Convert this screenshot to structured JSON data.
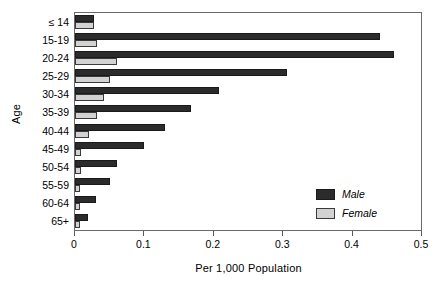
{
  "chart_data": {
    "type": "bar",
    "orientation": "horizontal",
    "title": "",
    "xlabel": "Per 1,000 Population",
    "ylabel": "Age",
    "xlim": [
      0,
      0.5
    ],
    "xticks": [
      "0",
      "0.1",
      "0.2",
      "0.3",
      "0.4",
      "0.5"
    ],
    "xtick_values": [
      0,
      0.1,
      0.2,
      0.3,
      0.4,
      0.5
    ],
    "grid": false,
    "legend_position": "lower-right-inside",
    "categories": [
      "≤ 14",
      "15-19",
      "20-24",
      "25-29",
      "30-34",
      "35-39",
      "40-44",
      "45-49",
      "50-54",
      "55-59",
      "60-64",
      "65+"
    ],
    "series": [
      {
        "name": "Male",
        "color": "#2b2b2b",
        "values": [
          0.028,
          0.44,
          0.46,
          0.305,
          0.207,
          0.167,
          0.13,
          0.1,
          0.06,
          0.05,
          0.03,
          0.019
        ]
      },
      {
        "name": "Female",
        "color": "#d2d2d2",
        "values": [
          0.027,
          0.031,
          0.061,
          0.051,
          0.042,
          0.031,
          0.02,
          0.008,
          0.008,
          0.007,
          0.007,
          0.007
        ]
      }
    ]
  },
  "legend": {
    "items": [
      {
        "label": "Male",
        "key": "male"
      },
      {
        "label": "Female",
        "key": "female"
      }
    ]
  }
}
